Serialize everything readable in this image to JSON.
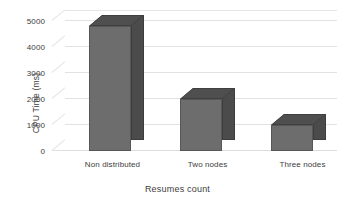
{
  "chart_data": {
    "type": "bar",
    "title": "",
    "subtitle": "",
    "xlabel": "Resumes count",
    "ylabel": "CPU Time (ms)",
    "categories": [
      "Non distributed",
      "Two nodes",
      "Three nodes"
    ],
    "values": [
      4800,
      2000,
      1000
    ],
    "ylim": [
      0,
      5000
    ],
    "yticks": [
      0,
      1000,
      2000,
      3000,
      4000,
      5000
    ],
    "ytick_labels": [
      "0",
      "1000",
      "2000",
      "3000",
      "4000",
      "5000"
    ],
    "grid": true,
    "grid_axis": "y",
    "legend": false,
    "legend_position": "none",
    "three_d": true,
    "series": [
      {
        "name": "CPU Time",
        "values": [
          4800,
          2000,
          1000
        ]
      }
    ],
    "colors": {
      "bar_front": "#6d6d6d",
      "bar_side": "#4b4b4b",
      "bar_top": "#4f4f4f",
      "gridline": "#e2e2e2",
      "background": "#ffffff",
      "text": "#3d3d3d"
    }
  }
}
